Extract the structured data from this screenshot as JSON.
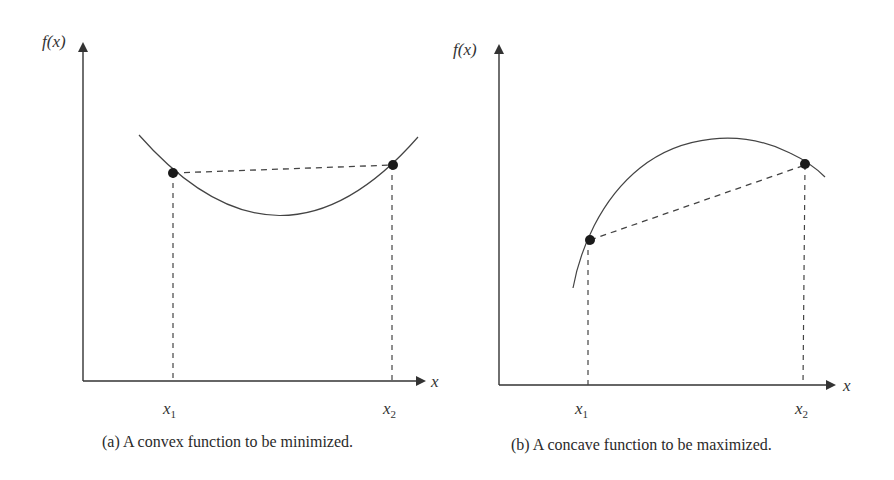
{
  "panels": [
    {
      "id": "a",
      "y_axis_label": "f(x)",
      "x_axis_label": "x",
      "tick_labels": {
        "x1": "x",
        "x1_sub": "1",
        "x2": "x",
        "x2_sub": "2"
      },
      "caption": "(a) A convex function to be minimized.",
      "curve_type": "convex"
    },
    {
      "id": "b",
      "y_axis_label": "f(x)",
      "x_axis_label": "x",
      "tick_labels": {
        "x1": "x",
        "x1_sub": "1",
        "x2": "x",
        "x2_sub": "2"
      },
      "caption": "(b) A concave function to be maximized.",
      "curve_type": "concave"
    }
  ],
  "colors": {
    "stroke": "#333333",
    "point": "#1a1a1a",
    "background": "#ffffff"
  }
}
